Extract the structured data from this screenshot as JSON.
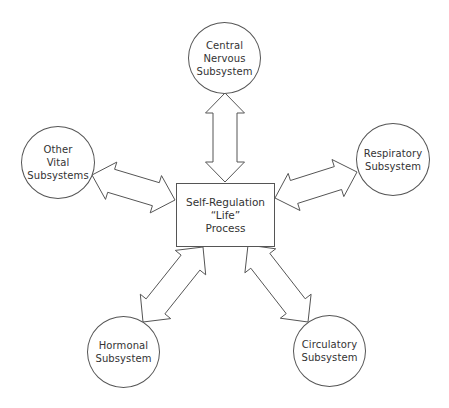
{
  "diagram": {
    "center": {
      "id": "self-regulation",
      "lines": [
        "Self-Regulation",
        "“Life”",
        "Process"
      ]
    },
    "nodes": [
      {
        "id": "central-nervous",
        "lines": [
          "Central",
          "Nervous",
          "Subsystem"
        ]
      },
      {
        "id": "other-vital",
        "lines": [
          "Other",
          "Vital",
          "Subsystems"
        ]
      },
      {
        "id": "respiratory",
        "lines": [
          "Respiratory",
          "Subsystem"
        ]
      },
      {
        "id": "hormonal",
        "lines": [
          "Hormonal",
          "Subsystem"
        ]
      },
      {
        "id": "circulatory",
        "lines": [
          "Circulatory",
          "Subsystem"
        ]
      }
    ],
    "edges": [
      {
        "from": "self-regulation",
        "to": "central-nervous",
        "type": "bidirectional"
      },
      {
        "from": "self-regulation",
        "to": "other-vital",
        "type": "bidirectional"
      },
      {
        "from": "self-regulation",
        "to": "respiratory",
        "type": "bidirectional"
      },
      {
        "from": "self-regulation",
        "to": "hormonal",
        "type": "bidirectional"
      },
      {
        "from": "self-regulation",
        "to": "circulatory",
        "type": "bidirectional"
      }
    ]
  }
}
